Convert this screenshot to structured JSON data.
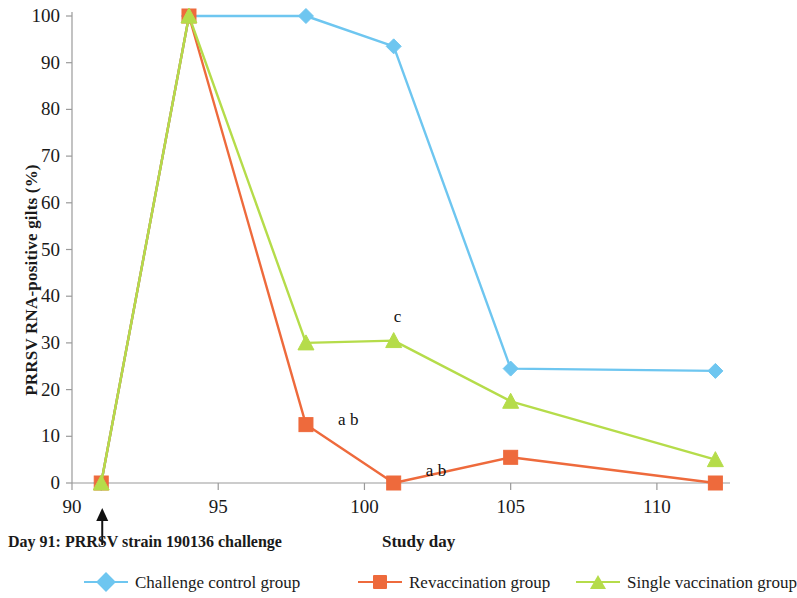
{
  "chart_data": {
    "type": "line",
    "title": "",
    "xlabel": "Study day",
    "ylabel": "PRRSV RNA-positive gilts (%)",
    "x": [
      91,
      94,
      98,
      101,
      105,
      112
    ],
    "xlim": [
      90,
      112.5
    ],
    "ylim": [
      0,
      100
    ],
    "xticks": [
      90,
      95,
      100,
      105,
      110
    ],
    "yticks": [
      0,
      10,
      20,
      30,
      40,
      50,
      60,
      70,
      80,
      90,
      100
    ],
    "grid": false,
    "legend_position": "bottom",
    "series": [
      {
        "name": "Challenge control group",
        "color": "#6EC6F0",
        "marker": "diamond",
        "values": [
          0,
          100,
          100,
          93.5,
          24.5,
          24
        ]
      },
      {
        "name": "Revaccination group",
        "color": "#EE6A3C",
        "marker": "square",
        "values": [
          0,
          100,
          12.5,
          0,
          5.5,
          0
        ]
      },
      {
        "name": "Single vaccination group",
        "color": "#B5DC4A",
        "marker": "triangle",
        "values": [
          0,
          100,
          30,
          30.5,
          17.5,
          5
        ]
      }
    ],
    "annotations": [
      {
        "text": "a b",
        "x": 99.1,
        "y": 13.5
      },
      {
        "text": "a b",
        "x": 102.1,
        "y": 2.5
      },
      {
        "text": "c",
        "x": 101.0,
        "y": 35.5
      }
    ],
    "event_annotation": {
      "text": "Day 91: PRRSV strain 190136 challenge",
      "arrow_x": 91,
      "arrow_label": "challenge-arrow"
    }
  },
  "axis": {
    "y_tick_labels": [
      "100",
      "90",
      "80",
      "70",
      "60",
      "50",
      "40",
      "30",
      "20",
      "10",
      "0"
    ],
    "x_tick_labels": [
      "90",
      "95",
      "100",
      "105",
      "110"
    ],
    "y_title": "PRRSV RNA-positive gilts (%)",
    "x_title": "Study day"
  },
  "legend": {
    "items": [
      {
        "label": "Challenge control group",
        "color": "#6EC6F0",
        "marker": "diamond"
      },
      {
        "label": "Revaccination group",
        "color": "#EE6A3C",
        "marker": "square"
      },
      {
        "label": "Single vaccination group",
        "color": "#B5DC4A",
        "marker": "triangle"
      }
    ]
  },
  "note": {
    "challenge_text": "Day 91: PRRSV strain 190136 challenge"
  }
}
